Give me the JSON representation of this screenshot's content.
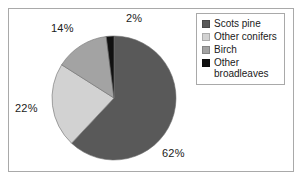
{
  "chart_data": {
    "type": "pie",
    "title": "",
    "subtitle": "",
    "xlabel": "",
    "ylabel": "",
    "grid": false,
    "legend_position": "top-right",
    "start_angle_deg": 0,
    "direction": "clockwise",
    "unit": "%",
    "categories": [
      "Scots pine",
      "Other conifers",
      "Birch",
      "Other broadleaves"
    ],
    "values": [
      62,
      22,
      14,
      2
    ],
    "value_labels": [
      "62%",
      "22%",
      "14%",
      "2%"
    ],
    "colors": [
      "#595959",
      "#d2d2d2",
      "#a3a3a3",
      "#111111"
    ],
    "slices": [
      {
        "label": "Scots pine",
        "value": 62,
        "value_label": "62%",
        "color": "#595959"
      },
      {
        "label": "Other conifers",
        "value": 22,
        "value_label": "22%",
        "color": "#d2d2d2"
      },
      {
        "label": "Birch",
        "value": 14,
        "value_label": "14%",
        "color": "#a3a3a3"
      },
      {
        "label": "Other broadleaves",
        "value": 2,
        "value_label": "2%",
        "color": "#111111"
      }
    ]
  },
  "legend": {
    "items": [
      {
        "label": "Scots pine",
        "color": "#595959"
      },
      {
        "label": "Other conifers",
        "color": "#d2d2d2"
      },
      {
        "label": "Birch",
        "color": "#a3a3a3"
      },
      {
        "label": "Other\nbroadleaves",
        "color": "#111111"
      }
    ]
  },
  "frame": {
    "border_color": "#a9a9a9",
    "background": "#ffffff"
  }
}
